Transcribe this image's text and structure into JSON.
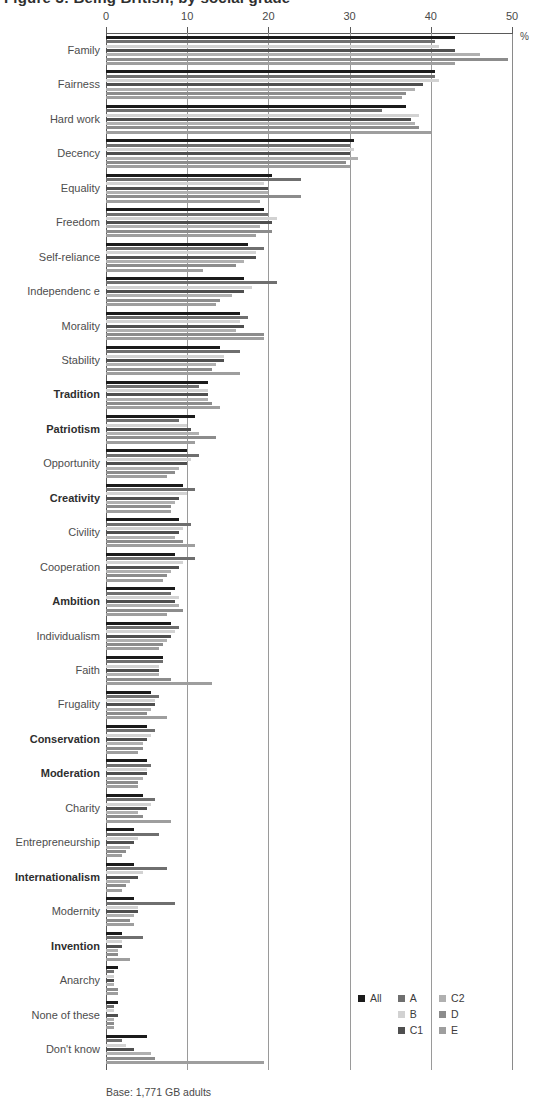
{
  "chart_data": {
    "type": "bar",
    "orientation": "horizontal",
    "title": "Figure 3: Being British, by social grade",
    "xlabel": "%",
    "ylabel": "",
    "xlim": [
      0,
      50
    ],
    "xticks": [
      0,
      10,
      20,
      30,
      40,
      50
    ],
    "grid": true,
    "legend_position": "bottom-right",
    "base_note": "Base: 1,771 GB adults",
    "axis_unit": "%",
    "categories": [
      "Family",
      "Fairness",
      "Hard work",
      "Decency",
      "Equality",
      "Freedom",
      "Self-reliance",
      "Independenc e",
      "Morality",
      "Stability",
      "Tradition",
      "Patriotism",
      "Opportunity",
      "Creativity",
      "Civility",
      "Cooperation",
      "Ambition",
      "Individualism",
      "Faith",
      "Frugality",
      "Conservation",
      "Moderation",
      "Charity",
      "Entrepreneurship",
      "Internationalism",
      "Modernity",
      "Invention",
      "Anarchy",
      "None of these",
      "Don't know"
    ],
    "bold_categories": [
      "Tradition",
      "Patriotism",
      "Creativity",
      "Ambition",
      "Conservation",
      "Moderation",
      "Internationalism",
      "Invention"
    ],
    "series": [
      {
        "name": "All",
        "color": "#1b1b1b",
        "values": [
          43.0,
          40.5,
          37.0,
          30.5,
          20.5,
          19.5,
          17.5,
          17.0,
          16.5,
          14.0,
          12.5,
          11.0,
          10.0,
          9.5,
          9.0,
          8.5,
          8.5,
          8.0,
          7.0,
          5.5,
          5.0,
          5.0,
          4.5,
          3.5,
          3.5,
          3.5,
          2.0,
          1.5,
          1.5,
          5.0
        ]
      },
      {
        "name": "A",
        "color": "#6f6f6f",
        "values": [
          40.5,
          40.5,
          34.0,
          30.0,
          24.0,
          20.0,
          19.5,
          21.0,
          17.5,
          16.5,
          11.5,
          9.0,
          11.5,
          11.0,
          10.5,
          11.0,
          8.0,
          9.0,
          7.0,
          6.5,
          6.0,
          5.5,
          6.0,
          6.5,
          7.5,
          8.5,
          4.5,
          1.0,
          1.0,
          2.0
        ]
      },
      {
        "name": "B",
        "color": "#d2d2d2",
        "values": [
          41.0,
          41.0,
          38.5,
          30.5,
          19.5,
          21.0,
          18.5,
          18.0,
          16.5,
          14.5,
          12.5,
          10.0,
          10.5,
          10.0,
          9.5,
          9.5,
          9.0,
          8.5,
          6.5,
          6.0,
          5.5,
          5.0,
          5.5,
          4.0,
          4.5,
          4.0,
          2.0,
          1.0,
          1.0,
          2.5
        ]
      },
      {
        "name": "C1",
        "color": "#4f4f4f",
        "values": [
          43.0,
          39.0,
          37.5,
          30.0,
          20.0,
          20.5,
          18.5,
          17.0,
          17.0,
          14.5,
          12.5,
          10.5,
          10.0,
          9.0,
          9.0,
          9.0,
          8.5,
          8.0,
          6.5,
          6.0,
          5.0,
          5.0,
          5.0,
          3.5,
          4.0,
          4.0,
          2.0,
          1.0,
          1.5,
          3.5
        ]
      },
      {
        "name": "C2",
        "color": "#b0b0b0",
        "values": [
          46.0,
          38.0,
          38.0,
          31.0,
          20.0,
          19.0,
          17.0,
          15.5,
          16.0,
          13.5,
          12.5,
          11.5,
          9.0,
          8.5,
          8.5,
          8.0,
          9.0,
          7.5,
          6.5,
          5.5,
          4.5,
          4.5,
          4.0,
          3.0,
          3.0,
          3.5,
          1.5,
          1.0,
          1.0,
          5.5
        ]
      },
      {
        "name": "D",
        "color": "#8c8c8c",
        "values": [
          49.5,
          37.0,
          38.5,
          29.5,
          24.0,
          20.5,
          16.0,
          14.0,
          19.5,
          13.0,
          13.0,
          13.5,
          8.5,
          8.0,
          9.5,
          7.5,
          9.5,
          7.0,
          8.0,
          5.0,
          4.5,
          4.0,
          4.5,
          2.5,
          2.5,
          3.0,
          1.5,
          1.5,
          1.0,
          6.0
        ]
      },
      {
        "name": "E",
        "color": "#9e9e9e",
        "values": [
          43.0,
          36.5,
          40.0,
          30.0,
          19.0,
          18.5,
          12.0,
          13.5,
          19.5,
          16.5,
          14.0,
          11.0,
          7.5,
          8.0,
          11.0,
          7.0,
          7.5,
          6.5,
          13.0,
          7.5,
          4.0,
          4.0,
          8.0,
          2.0,
          2.0,
          3.5,
          3.0,
          1.5,
          1.0,
          19.5
        ]
      }
    ]
  },
  "legend": {
    "columns": [
      [
        {
          "label": "All",
          "color": "#1b1b1b"
        }
      ],
      [
        {
          "label": "A",
          "color": "#6f6f6f"
        },
        {
          "label": "B",
          "color": "#d2d2d2"
        },
        {
          "label": "C1",
          "color": "#4f4f4f"
        }
      ],
      [
        {
          "label": "C2",
          "color": "#b0b0b0"
        },
        {
          "label": "D",
          "color": "#8c8c8c"
        },
        {
          "label": "E",
          "color": "#9e9e9e"
        }
      ]
    ]
  },
  "footer": {
    "base": "Base: 1,771 GB adults"
  }
}
